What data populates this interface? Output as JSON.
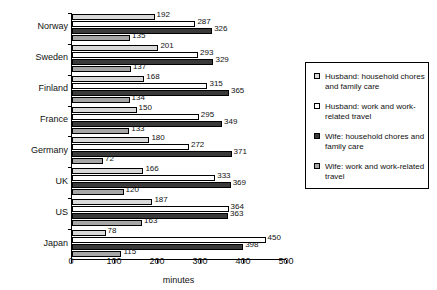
{
  "chart_data": {
    "type": "bar",
    "orientation": "horizontal",
    "title": "",
    "xlabel": "minutes",
    "ylabel": "",
    "xlim": [
      0,
      500
    ],
    "xticks": [
      0,
      100,
      200,
      300,
      400,
      500
    ],
    "grid": false,
    "legend_position": "right",
    "categories": [
      "Norway",
      "Sweden",
      "Finland",
      "France",
      "Germany",
      "UK",
      "US",
      "Japan"
    ],
    "series": [
      {
        "name": "Husband: household chores and family care",
        "key": "husband_chores",
        "color": "#d9d9d9",
        "values": [
          192,
          201,
          168,
          150,
          180,
          166,
          187,
          78
        ]
      },
      {
        "name": "Husband: work and work-related travel",
        "key": "husband_work",
        "color": "#ffffff",
        "values": [
          287,
          293,
          315,
          295,
          272,
          333,
          364,
          450
        ]
      },
      {
        "name": "Wife: household chores and family care",
        "key": "wife_chores",
        "color": "#3a3a3a",
        "values": [
          326,
          329,
          365,
          349,
          371,
          369,
          363,
          398
        ]
      },
      {
        "name": "Wife: work and work-related travel",
        "key": "wife_work",
        "color": "#a6a6a6",
        "values": [
          135,
          137,
          134,
          133,
          72,
          120,
          163,
          115
        ]
      }
    ]
  },
  "legend": {
    "items": [
      {
        "label": "Husband: household chores and family care",
        "swatch": "s0"
      },
      {
        "label": "Husband: work and work-related travel",
        "swatch": "s1"
      },
      {
        "label": "Wife: household chores and family care",
        "swatch": "s2"
      },
      {
        "label": "Wife: work and work-related travel",
        "swatch": "s3"
      }
    ]
  },
  "axis": {
    "x_label": "minutes",
    "x_tick_labels": [
      "0",
      "100",
      "200",
      "300",
      "400",
      "500"
    ]
  }
}
